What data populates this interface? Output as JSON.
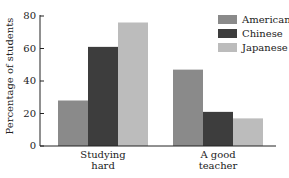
{
  "chart_data": {
    "type": "bar",
    "title": "",
    "xlabel": "",
    "ylabel": "Percentage of students",
    "ylim": [
      0,
      80
    ],
    "yticks": [
      0,
      20,
      40,
      60,
      80
    ],
    "categories": [
      "Studying hard",
      "A good teacher"
    ],
    "category_lines": [
      [
        "Studying",
        "hard"
      ],
      [
        "A good",
        "teacher"
      ]
    ],
    "series": [
      {
        "name": "Americans",
        "color": "#8a8a8a",
        "values": [
          28,
          47
        ]
      },
      {
        "name": "Chinese",
        "color": "#3d3d3d",
        "values": [
          61,
          21
        ]
      },
      {
        "name": "Japanese",
        "color": "#bcbcbc",
        "values": [
          76,
          17
        ]
      }
    ],
    "grid": false,
    "legend_position": "top-right"
  },
  "labels": {
    "ylabel": "Percentage of students",
    "ticks": [
      "0",
      "20",
      "40",
      "60",
      "80"
    ],
    "cat1_line1": "Studying",
    "cat1_line2": "hard",
    "cat2_line1": "A good",
    "cat2_line2": "teacher",
    "legend": [
      "Americans",
      "Chinese",
      "Japanese"
    ]
  }
}
